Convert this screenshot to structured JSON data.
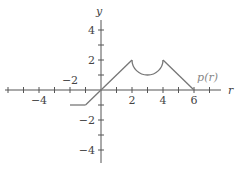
{
  "chart_data": {
    "type": "line",
    "title": "",
    "xlabel": "r",
    "ylabel": "y",
    "xlim": [
      -6,
      8
    ],
    "ylim": [
      -5,
      5
    ],
    "x_ticks": [
      -6,
      -5,
      -4,
      -3,
      -2,
      -1,
      1,
      2,
      3,
      4,
      5,
      6,
      7
    ],
    "y_ticks": [
      -4,
      -3,
      -2,
      -1,
      1,
      2,
      3,
      4
    ],
    "x_tick_labels": [
      {
        "value": -4,
        "label": "−4"
      },
      {
        "value": -2,
        "label": "−2"
      },
      {
        "value": 2,
        "label": "2"
      },
      {
        "value": 4,
        "label": "4"
      },
      {
        "value": 6,
        "label": "6"
      }
    ],
    "y_tick_labels": [
      {
        "value": 4,
        "label": "4"
      },
      {
        "value": 2,
        "label": "2"
      },
      {
        "value": -2,
        "label": "−2"
      },
      {
        "value": -4,
        "label": "−4"
      }
    ],
    "series": [
      {
        "name": "p(r)",
        "segments": [
          {
            "kind": "line",
            "points": [
              [
                -2,
                -1
              ],
              [
                -1,
                -1
              ]
            ]
          },
          {
            "kind": "line",
            "points": [
              [
                -1,
                -1
              ],
              [
                2,
                2
              ]
            ]
          },
          {
            "kind": "semicircle",
            "center": [
              3,
              2
            ],
            "radius": 1,
            "direction": "down"
          },
          {
            "kind": "line",
            "points": [
              [
                4,
                2
              ],
              [
                6,
                0
              ]
            ]
          }
        ]
      }
    ],
    "annotations": [
      {
        "text": "p(r)",
        "x": 6.2,
        "y": 0.6
      }
    ],
    "grid": false,
    "legend": "none"
  }
}
